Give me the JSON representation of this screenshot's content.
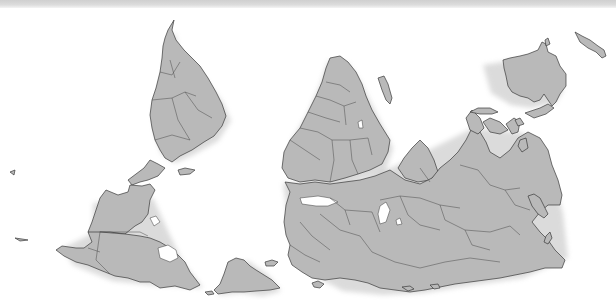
{
  "map": {
    "projection": "south-up world map",
    "colors": {
      "land": "#b9b9b9",
      "border": "#3a3a3a",
      "water": "#ffffff",
      "top_band": "#d4d4d4"
    },
    "regions": [
      {
        "id": "south-america",
        "label": ""
      },
      {
        "id": "north-america",
        "label": ""
      },
      {
        "id": "greenland",
        "label": ""
      },
      {
        "id": "africa",
        "label": ""
      },
      {
        "id": "madagascar",
        "label": ""
      },
      {
        "id": "eurasia",
        "label": ""
      },
      {
        "id": "australia",
        "label": ""
      },
      {
        "id": "new-zealand",
        "label": ""
      },
      {
        "id": "southeast-asia-islands",
        "label": ""
      },
      {
        "id": "japan",
        "label": ""
      }
    ]
  }
}
